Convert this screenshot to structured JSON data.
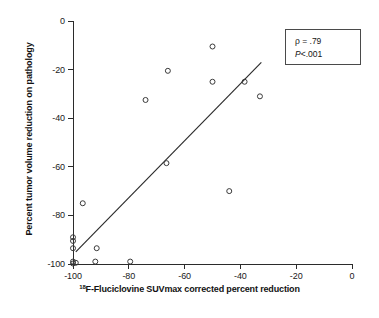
{
  "chart_data": {
    "type": "scatter",
    "title": "",
    "xlabel": "18F-Fluciclovine SUVmax corrected percent reduction",
    "xlabel_prefix_superscript": "18",
    "xlabel_rest": "F-Fluciclovine SUVmax corrected percent reduction",
    "ylabel": "Percent tumor volume reduction on pathology",
    "xlim": [
      -100,
      0
    ],
    "ylim": [
      -100,
      0
    ],
    "xticks": [
      -100,
      -80,
      -60,
      -40,
      -20,
      0
    ],
    "xtick_labels": [
      "-100",
      "-80",
      "-60",
      "-40",
      "-20",
      "0"
    ],
    "yticks": [
      0,
      -20,
      -40,
      -60,
      -80,
      -100
    ],
    "ytick_labels": [
      "0",
      "-20",
      "-40",
      "-60",
      "-80",
      "-100"
    ],
    "grid": false,
    "legend_position": "top-right",
    "marker": "open-circle",
    "marker_color": "#3a3a3a",
    "line_color": "#2b2b2b",
    "points": [
      {
        "x": -50.0,
        "y": -10.5
      },
      {
        "x": -66.0,
        "y": -20.5
      },
      {
        "x": -50.0,
        "y": -25.0
      },
      {
        "x": -38.5,
        "y": -25.0
      },
      {
        "x": -33.0,
        "y": -31.0
      },
      {
        "x": -74.0,
        "y": -32.5
      },
      {
        "x": -66.5,
        "y": -58.5
      },
      {
        "x": -44.0,
        "y": -70.0
      },
      {
        "x": -96.5,
        "y": -75.0
      },
      {
        "x": -100.0,
        "y": -89.0
      },
      {
        "x": -100.0,
        "y": -90.5
      },
      {
        "x": -100.0,
        "y": -93.5
      },
      {
        "x": -91.5,
        "y": -93.5
      },
      {
        "x": -100.0,
        "y": -99.0
      },
      {
        "x": -100.0,
        "y": -99.8
      },
      {
        "x": -99.0,
        "y": -99.5
      },
      {
        "x": -92.0,
        "y": -99.0
      },
      {
        "x": -79.5,
        "y": -99.0
      }
    ],
    "trendline": {
      "x_start": -99.0,
      "y_start": -95.0,
      "x_end": -32.5,
      "y_end": -17.0
    },
    "annotations": {
      "rho_label": "ρ  =  .79",
      "pvalue_label": "P<.001"
    }
  },
  "stats_box": {
    "rho": "ρ  =  .79",
    "pvalue_italic": "P",
    "pvalue_rest": "<.001"
  }
}
